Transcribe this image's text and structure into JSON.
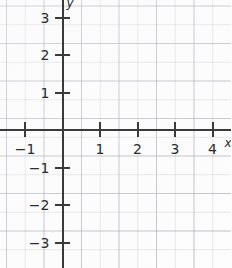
{
  "chart_data": {
    "type": "scatter",
    "title": "",
    "subtitle": "",
    "xlabel": "x",
    "ylabel": "y",
    "grid": true,
    "legend": false,
    "xlim": [
      -1.65,
      4.5
    ],
    "ylim": [
      -3.65,
      3.65
    ],
    "x_ticks": [
      -1,
      1,
      2,
      3,
      4
    ],
    "x_tick_labels": [
      "−1",
      "1",
      "2",
      "3",
      "4"
    ],
    "y_ticks": [
      3,
      2,
      1,
      -1,
      -2,
      -3
    ],
    "y_tick_labels": [
      "3",
      "2",
      "1",
      "−1",
      "−2",
      "−3"
    ],
    "series": [],
    "values": [],
    "categories": []
  },
  "axes": {
    "x_axis_label": "x",
    "y_axis_label": "y",
    "origin_label": ""
  },
  "colors": {
    "background": "#fcfcfc",
    "axis": "#3a3a3a",
    "grid_minor": "#969ba5",
    "grid_major": "#78808c",
    "label_text": "#2b2b2b"
  },
  "geometry": {
    "origin_x_px": 62.5,
    "origin_y_px": 130,
    "unit_px": 37.5
  }
}
